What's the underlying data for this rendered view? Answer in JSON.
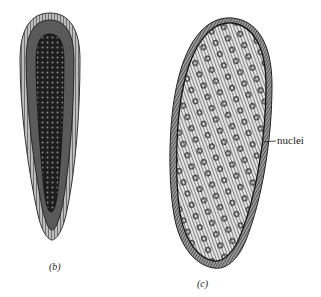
{
  "figure": {
    "panels": [
      {
        "id": "b",
        "label": "(b)"
      },
      {
        "id": "c",
        "label": "(c)"
      }
    ],
    "annotations": [
      {
        "text": "nuclei",
        "points_to": "c"
      }
    ]
  },
  "colors": {
    "background": "#ffffff",
    "ink": "#1a1a1a",
    "cell_fill_c": "#d8d8d8",
    "cell_fill_b": "#3a3a3a"
  }
}
